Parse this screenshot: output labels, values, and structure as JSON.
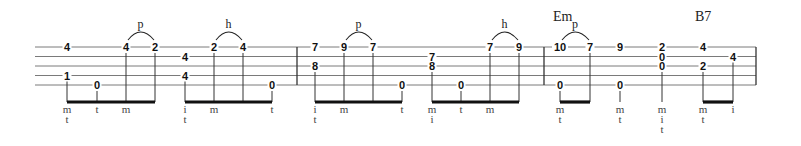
{
  "staff": {
    "x_start": 35,
    "x_end": 756,
    "lines_y": [
      47,
      56.5,
      66,
      75.5,
      85
    ],
    "barlines_x": [
      297,
      544,
      756
    ]
  },
  "chords": [
    {
      "label": "Em",
      "x": 553,
      "y": 21
    },
    {
      "label": "B7",
      "x": 695,
      "y": 21
    }
  ],
  "beam_y": 102,
  "finger_rows_y": [
    113,
    123,
    133
  ],
  "groups": [
    {
      "beamed": true,
      "notes": [
        {
          "x": 67,
          "frets": [
            {
              "string": 1,
              "fret": "4"
            },
            {
              "string": 4,
              "fret": "1"
            }
          ],
          "fingers": [
            "m",
            "t"
          ]
        },
        {
          "x": 97,
          "frets": [
            {
              "string": 5,
              "fret": "0"
            }
          ],
          "fingers": [
            "t"
          ]
        },
        {
          "x": 126,
          "frets": [
            {
              "string": 1,
              "fret": "4"
            }
          ],
          "fingers": [
            "m"
          ]
        },
        {
          "x": 155,
          "frets": [
            {
              "string": 1,
              "fret": "2"
            }
          ],
          "fingers": []
        }
      ],
      "slur": {
        "from": 2,
        "to": 3,
        "string": 1,
        "label": "p"
      }
    },
    {
      "beamed": true,
      "notes": [
        {
          "x": 185,
          "frets": [
            {
              "string": 2,
              "fret": "4"
            },
            {
              "string": 4,
              "fret": "4"
            }
          ],
          "fingers": [
            "i",
            "t"
          ]
        },
        {
          "x": 214,
          "frets": [
            {
              "string": 1,
              "fret": "2"
            }
          ],
          "fingers": [
            "m"
          ]
        },
        {
          "x": 243,
          "frets": [
            {
              "string": 1,
              "fret": "4"
            }
          ],
          "fingers": []
        },
        {
          "x": 272,
          "frets": [
            {
              "string": 5,
              "fret": "0"
            }
          ],
          "fingers": [
            "t"
          ]
        }
      ],
      "slur": {
        "from": 1,
        "to": 2,
        "string": 1,
        "label": "h"
      }
    },
    {
      "beamed": true,
      "notes": [
        {
          "x": 315,
          "frets": [
            {
              "string": 1,
              "fret": "7"
            },
            {
              "string": 3,
              "fret": "8"
            }
          ],
          "fingers": [
            "i",
            "t"
          ]
        },
        {
          "x": 344,
          "frets": [
            {
              "string": 1,
              "fret": "9"
            }
          ],
          "fingers": [
            "m"
          ]
        },
        {
          "x": 373,
          "frets": [
            {
              "string": 1,
              "fret": "7"
            }
          ],
          "fingers": []
        },
        {
          "x": 402,
          "frets": [
            {
              "string": 5,
              "fret": "0"
            }
          ],
          "fingers": [
            "t"
          ]
        }
      ],
      "slur": {
        "from": 1,
        "to": 2,
        "string": 1,
        "label": "p"
      }
    },
    {
      "beamed": true,
      "notes": [
        {
          "x": 432,
          "frets": [
            {
              "string": 2,
              "fret": "7"
            },
            {
              "string": 3,
              "fret": "8"
            }
          ],
          "fingers": [
            "m",
            "i"
          ]
        },
        {
          "x": 461,
          "frets": [
            {
              "string": 5,
              "fret": "0"
            }
          ],
          "fingers": [
            "t"
          ]
        },
        {
          "x": 490,
          "frets": [
            {
              "string": 1,
              "fret": "7"
            }
          ],
          "fingers": [
            "m"
          ]
        },
        {
          "x": 519,
          "frets": [
            {
              "string": 1,
              "fret": "9"
            }
          ],
          "fingers": []
        }
      ],
      "slur": {
        "from": 2,
        "to": 3,
        "string": 1,
        "label": "h"
      }
    },
    {
      "beamed": true,
      "notes": [
        {
          "x": 560,
          "frets": [
            {
              "string": 1,
              "fret": "10"
            },
            {
              "string": 5,
              "fret": "0"
            }
          ],
          "fingers": [
            "m",
            "t"
          ]
        },
        {
          "x": 590,
          "frets": [
            {
              "string": 1,
              "fret": "7"
            }
          ],
          "fingers": []
        }
      ],
      "slur": {
        "from": 0,
        "to": 1,
        "string": 1,
        "label": "p"
      }
    },
    {
      "beamed": false,
      "notes": [
        {
          "x": 620,
          "frets": [
            {
              "string": 1,
              "fret": "9"
            },
            {
              "string": 5,
              "fret": "0"
            }
          ],
          "fingers": [
            "m",
            "t"
          ]
        }
      ]
    },
    {
      "beamed": false,
      "notes": [
        {
          "x": 662,
          "frets": [
            {
              "string": 1,
              "fret": "2"
            },
            {
              "string": 2,
              "fret": "0"
            },
            {
              "string": 3,
              "fret": "0"
            }
          ],
          "fingers": [
            "m",
            "i",
            "t"
          ]
        }
      ]
    },
    {
      "beamed": true,
      "notes": [
        {
          "x": 703,
          "frets": [
            {
              "string": 1,
              "fret": "4"
            },
            {
              "string": 3,
              "fret": "2"
            }
          ],
          "fingers": [
            "m",
            "t"
          ]
        },
        {
          "x": 733,
          "frets": [
            {
              "string": 2,
              "fret": "4"
            }
          ],
          "fingers": [
            "i"
          ]
        }
      ]
    }
  ]
}
